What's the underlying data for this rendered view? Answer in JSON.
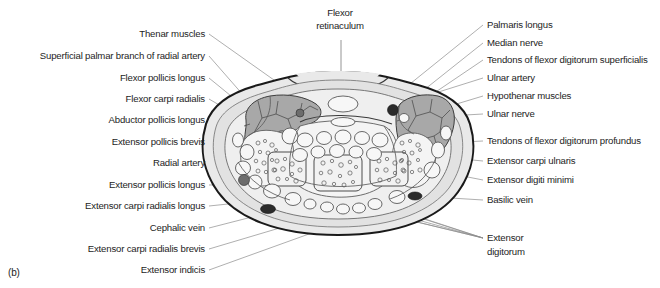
{
  "figure": {
    "panel_label": "(b)",
    "type": "anatomical cross-section of the wrist (transverse section through the carpal tunnel)"
  },
  "labels_top": [
    {
      "id": "flexor-retinaculum",
      "line1": "Flexor",
      "line2": "retinaculum",
      "x": 340,
      "y": 16
    }
  ],
  "labels_left": [
    {
      "id": "thenar-muscles",
      "text": "Thenar muscles",
      "x": 205,
      "y": 37
    },
    {
      "id": "superficial-palmar-branch-radial-artery",
      "text": "Superficial palmar branch of radial artery",
      "x": 205,
      "y": 59
    },
    {
      "id": "flexor-pollicis-longus",
      "text": "Flexor pollicis longus",
      "x": 205,
      "y": 81
    },
    {
      "id": "flexor-carpi-radialis",
      "text": "Flexor carpi radialis",
      "x": 205,
      "y": 102
    },
    {
      "id": "abductor-pollicis-longus",
      "text": "Abductor pollicis longus",
      "x": 205,
      "y": 123
    },
    {
      "id": "extensor-pollicis-brevis",
      "text": "Extensor pollicis brevis",
      "x": 205,
      "y": 145
    },
    {
      "id": "radial-artery",
      "text": "Radial artery",
      "x": 205,
      "y": 166
    },
    {
      "id": "extensor-pollicis-longus",
      "text": "Extensor pollicis longus",
      "x": 205,
      "y": 188
    },
    {
      "id": "extensor-carpi-radialis-longus",
      "text": "Extensor carpi radialis longus",
      "x": 205,
      "y": 209
    },
    {
      "id": "cephalic-vein",
      "text": "Cephalic vein",
      "x": 205,
      "y": 231
    },
    {
      "id": "extensor-carpi-radialis-brevis",
      "text": "Extensor carpi radialis brevis",
      "x": 205,
      "y": 252
    },
    {
      "id": "extensor-indicis",
      "text": "Extensor indicis",
      "x": 205,
      "y": 273
    }
  ],
  "labels_right": [
    {
      "id": "palmaris-longus",
      "text": "Palmaris longus",
      "x": 487,
      "y": 28
    },
    {
      "id": "median-nerve",
      "text": "Median nerve",
      "x": 487,
      "y": 46
    },
    {
      "id": "tendons-flexor-digitorum-superficialis",
      "text": "Tendons of flexor digitorum superficialis",
      "x": 487,
      "y": 63
    },
    {
      "id": "ulnar-artery",
      "text": "Ulnar artery",
      "x": 487,
      "y": 81
    },
    {
      "id": "hypothenar-muscles",
      "text": "Hypothenar muscles",
      "x": 487,
      "y": 99
    },
    {
      "id": "ulnar-nerve",
      "text": "Ulnar nerve",
      "x": 487,
      "y": 117
    },
    {
      "id": "tendons-flexor-digitorum-profundus",
      "text": "Tendons of flexor digitorum profundus",
      "x": 487,
      "y": 144
    },
    {
      "id": "extensor-carpi-ulnaris",
      "text": "Extensor carpi ulnaris",
      "x": 487,
      "y": 164
    },
    {
      "id": "extensor-digiti-minimi",
      "text": "Extensor digiti minimi",
      "x": 487,
      "y": 183
    },
    {
      "id": "basilic-vein",
      "text": "Basilic vein",
      "x": 487,
      "y": 203
    }
  ],
  "labels_right_multiline": [
    {
      "id": "extensor-digitorum",
      "line1": "Extensor",
      "line2": "digitorum",
      "x": 487,
      "y": 241
    }
  ],
  "colors": {
    "skin_outline": "#1a1a1a",
    "subcutaneous": "#e9e9e9",
    "fascia": "#efefef",
    "muscle": "#a8a8a8",
    "bone": "#f2f2f2",
    "tendon": "#f7f7f7",
    "vessel_dark": "#2b2b2b",
    "vessel_mid": "#6d6d6d",
    "leader_line": "#8d8d8d",
    "text": "#1d1d1d",
    "background": "#ffffff"
  }
}
